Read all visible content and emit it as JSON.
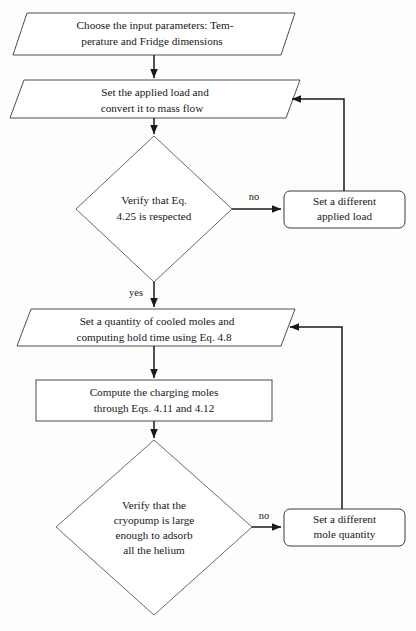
{
  "diagram": {
    "type": "flowchart",
    "background_color": "#fdfdfc",
    "line_color": "#1a1a1a",
    "text_color": "#17171a",
    "nodes": [
      {
        "id": "input-parameters",
        "shape": "parallelogram",
        "lines": [
          "Choose the input parameters: Tem-",
          "perature and Fridge dimensions"
        ]
      },
      {
        "id": "applied-load",
        "shape": "parallelogram",
        "lines": [
          "Set the applied load and",
          "convert it to mass flow"
        ]
      },
      {
        "id": "verify-eq-425",
        "shape": "diamond",
        "lines": [
          "Verify that Eq.",
          "4.25 is respected"
        ]
      },
      {
        "id": "different-applied-load",
        "shape": "rounded-rectangle",
        "lines": [
          "Set a different",
          "applied load"
        ]
      },
      {
        "id": "cooled-moles",
        "shape": "parallelogram",
        "lines": [
          "Set a quantity of cooled moles and",
          "computing hold time using Eq. 4.8"
        ]
      },
      {
        "id": "charging-moles",
        "shape": "rectangle",
        "lines": [
          "Compute the charging moles",
          "through Eqs. 4.11 and 4.12"
        ]
      },
      {
        "id": "verify-cryopump",
        "shape": "diamond",
        "lines": [
          "Verify that the",
          "cryopump is large",
          "enough to adsorb",
          "all the helium"
        ]
      },
      {
        "id": "different-mole-quantity",
        "shape": "rounded-rectangle",
        "lines": [
          "Set a different",
          "mole quantity"
        ]
      }
    ],
    "edge_labels": {
      "no_upper": "no",
      "yes_upper": "yes",
      "no_lower": "no"
    }
  }
}
